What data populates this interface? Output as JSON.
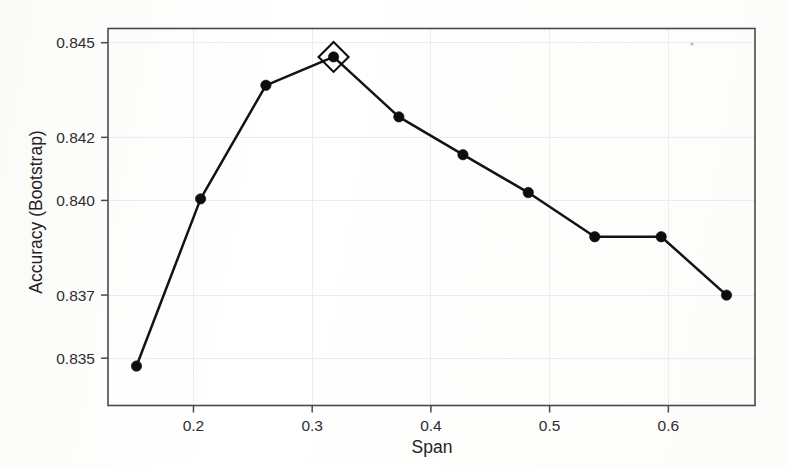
{
  "figure": {
    "background_color": "#fdfdfd",
    "ink_color": "#131313",
    "grid_color": "#ececec",
    "frame_color": "#4a4a4a"
  },
  "chart_data": {
    "type": "line",
    "title": "",
    "subtitle": "",
    "xlabel": "Span",
    "ylabel": "Accuracy (Bootstrap)",
    "xlim": [
      0.128,
      0.673
    ],
    "ylim": [
      0.8335,
      0.84545
    ],
    "grid": true,
    "legend": "none",
    "xticks": [
      0.2,
      0.3,
      0.4,
      0.5,
      0.6
    ],
    "xticklabels": [
      "0.2",
      "0.3",
      "0.4",
      "0.5",
      "0.6"
    ],
    "yticks": [
      0.835,
      0.837,
      0.84,
      0.842,
      0.845
    ],
    "yticklabels": [
      "0.835",
      "0.837",
      "0.840",
      "0.842",
      "0.845"
    ],
    "x": [
      0.152,
      0.206,
      0.261,
      0.318,
      0.373,
      0.427,
      0.482,
      0.538,
      0.594,
      0.649
    ],
    "y": [
      0.83475,
      0.84005,
      0.84365,
      0.84455,
      0.84265,
      0.84145,
      0.84025,
      0.83885,
      0.83885,
      0.837
    ],
    "series": [
      {
        "name": "Accuracy (Bootstrap)",
        "marker": "filled-circle",
        "values": [
          0.83475,
          0.84005,
          0.84365,
          0.84455,
          0.84265,
          0.84145,
          0.84025,
          0.83885,
          0.83885,
          0.837
        ]
      }
    ],
    "annotations": [
      {
        "kind": "best-point-diamond",
        "x": 0.318,
        "y": 0.84455,
        "label": ""
      }
    ]
  }
}
